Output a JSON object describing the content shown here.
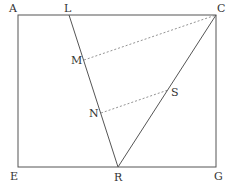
{
  "diagram": {
    "type": "geometry",
    "line_color": "#555555",
    "dash_color": "#777777",
    "rectangle": [
      "A",
      "C",
      "G",
      "E"
    ],
    "points": [
      {
        "name": "A",
        "label": "A",
        "x": 18,
        "y": 15,
        "lx": 9,
        "ly": 12
      },
      {
        "name": "L",
        "label": "L",
        "x": 69,
        "y": 15,
        "lx": 64,
        "ly": 12
      },
      {
        "name": "C",
        "label": "C",
        "x": 216,
        "y": 15,
        "lx": 217,
        "ly": 12
      },
      {
        "name": "M",
        "label": "M",
        "x": 84,
        "y": 60,
        "lx": 71,
        "ly": 64
      },
      {
        "name": "S",
        "label": "S",
        "x": 168,
        "y": 90,
        "lx": 171,
        "ly": 96
      },
      {
        "name": "N",
        "label": "N",
        "x": 101,
        "y": 113,
        "lx": 89,
        "ly": 117
      },
      {
        "name": "E",
        "label": "E",
        "x": 18,
        "y": 167,
        "lx": 10,
        "ly": 180
      },
      {
        "name": "R",
        "label": "R",
        "x": 118,
        "y": 167,
        "lx": 114,
        "ly": 181
      },
      {
        "name": "G",
        "label": "G",
        "x": 216,
        "y": 167,
        "lx": 214,
        "ly": 180
      }
    ],
    "solid_segments": [
      [
        "L",
        "R"
      ],
      [
        "C",
        "R"
      ]
    ],
    "dashed_segments": [
      [
        "M",
        "C"
      ],
      [
        "N",
        "S"
      ]
    ]
  }
}
